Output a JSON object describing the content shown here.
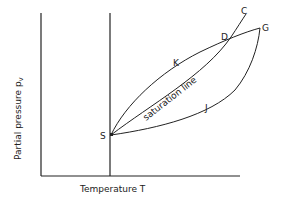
{
  "diagram": {
    "type": "psychrometric-process-diagram",
    "x_axis_label": "Temperature T",
    "y_axis_label": "Partial pressure p",
    "y_axis_label_subscript": "v",
    "curve_label": "saturation line",
    "points": {
      "S": "S",
      "K": "K",
      "D": "D",
      "C": "C",
      "G": "G",
      "J": "J"
    }
  },
  "colors": {
    "line": "#222222",
    "background": "#ffffff"
  }
}
